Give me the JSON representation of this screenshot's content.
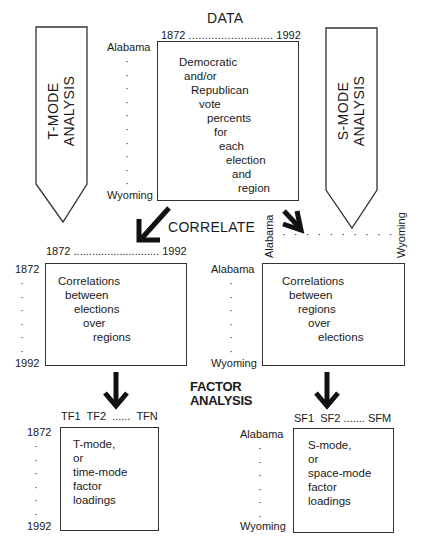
{
  "title": "DATA",
  "t_mode_arrow": {
    "line1": "T-MODE",
    "line2": "ANALYSIS"
  },
  "s_mode_arrow": {
    "line1": "S-MODE",
    "line2": "ANALYSIS"
  },
  "data_matrix": {
    "col_start": "1872",
    "col_dots": "..........................",
    "col_end": "1992",
    "row_start": "Alabama",
    "row_end": "Wyoming",
    "lines": [
      "Democratic",
      "and/or",
      "Republican",
      "vote",
      "percents",
      "for",
      "each",
      "election",
      "and",
      "region"
    ]
  },
  "correlate_label": "CORRELATE",
  "t_corr_matrix": {
    "col_start": "1872",
    "col_dots": "............................",
    "col_end": "1992",
    "row_start": "1872",
    "row_end": "1992",
    "lines": [
      "Correlations",
      "between",
      "elections",
      "over",
      "regions"
    ]
  },
  "s_corr_matrix": {
    "col_start": "Alabama",
    "col_end": "Wyoming",
    "row_start": "Alabama",
    "row_end": "Wyoming",
    "lines": [
      "Correlations",
      "between",
      "regions",
      "over",
      "elections"
    ]
  },
  "factor_label": {
    "line1": "FACTOR",
    "line2": "ANALYSIS"
  },
  "t_loadings": {
    "col_labels": "TF1  TF2  ......  TFN",
    "row_start": "1872",
    "row_end": "1992",
    "lines": [
      "T-mode,",
      "or",
      "time-mode",
      "factor",
      "loadings"
    ]
  },
  "s_loadings": {
    "col_labels": "SF1  SF2 ....... SFM",
    "row_start": "Alabama",
    "row_end": "Wyoming",
    "lines": [
      "S-mode,",
      "or",
      "space-mode",
      "factor",
      "loadings"
    ]
  }
}
